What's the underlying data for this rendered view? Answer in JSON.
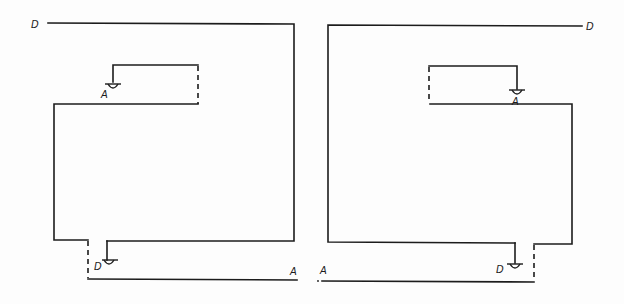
{
  "diagram": {
    "background": "#fdfdfd",
    "stroke_color": "#1c1c1c",
    "left_figure": {
      "labels": {
        "top_start": "D",
        "inner_symbol": "A",
        "bottom_symbol": "D",
        "bottom_end": "A"
      }
    },
    "right_figure": {
      "labels": {
        "top_end": "D",
        "inner_symbol": "A",
        "bottom_symbol": "D",
        "bottom_start": "A"
      }
    },
    "symbols": [
      "ground-terminal",
      "ground-terminal",
      "ground-terminal",
      "ground-terminal"
    ]
  }
}
